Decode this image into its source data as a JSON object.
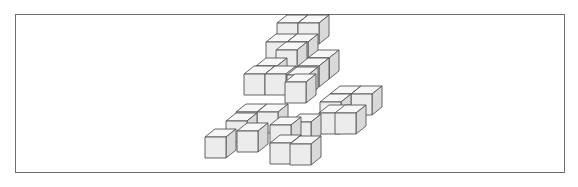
{
  "figure": {
    "frame_color": "#6e6e6e",
    "colors": {
      "top": "#f7f7f7",
      "front": "#ececec",
      "side": "#d9d9d9",
      "edge": "#555555"
    },
    "cube_size": 21,
    "depth_offset": [
      10,
      -8
    ],
    "cube_count": 26,
    "cubes": [
      {
        "x": 277,
        "y": 23
      },
      {
        "x": 298,
        "y": 23
      },
      {
        "x": 266,
        "y": 42
      },
      {
        "x": 287,
        "y": 42
      },
      {
        "x": 308,
        "y": 58
      },
      {
        "x": 276,
        "y": 50
      },
      {
        "x": 256,
        "y": 66
      },
      {
        "x": 298,
        "y": 66
      },
      {
        "x": 287,
        "y": 75
      },
      {
        "x": 244,
        "y": 74
      },
      {
        "x": 265,
        "y": 74
      },
      {
        "x": 285,
        "y": 82
      },
      {
        "x": 330,
        "y": 94
      },
      {
        "x": 351,
        "y": 94
      },
      {
        "x": 320,
        "y": 102
      },
      {
        "x": 335,
        "y": 113
      },
      {
        "x": 319,
        "y": 113
      },
      {
        "x": 236,
        "y": 112
      },
      {
        "x": 257,
        "y": 112
      },
      {
        "x": 226,
        "y": 121
      },
      {
        "x": 270,
        "y": 125
      },
      {
        "x": 270,
        "y": 143
      },
      {
        "x": 205,
        "y": 137
      },
      {
        "x": 237,
        "y": 131
      },
      {
        "x": 290,
        "y": 144
      },
      {
        "x": 290,
        "y": 122
      }
    ]
  }
}
